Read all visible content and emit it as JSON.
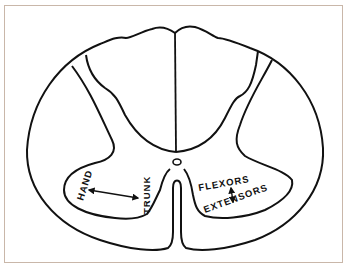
{
  "figure": {
    "type": "spinal cord cross-section",
    "colors": {
      "line": "#111111",
      "frame": "#c9b7a9",
      "background": "#ffffff"
    }
  },
  "labels": {
    "left_ventral_horn": {
      "hand": "HAND",
      "trunk": "TRUNK",
      "relation": "hand-trunk-double-arrow"
    },
    "right_ventral_horn": {
      "flexors": "FLEXORS",
      "extensors": "EXTENSORS",
      "relation": "flexors-extensors-double-arrow"
    }
  }
}
